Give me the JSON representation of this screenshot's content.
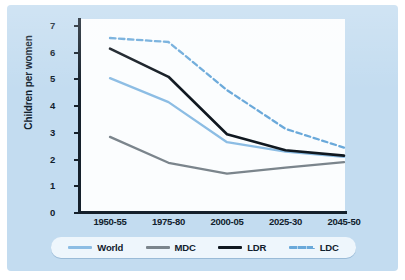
{
  "chart_data": {
    "type": "line",
    "title": "",
    "xlabel": "",
    "ylabel": "Children per women",
    "categories": [
      "1950-55",
      "1975-80",
      "2000-05",
      "2025-30",
      "2045-50"
    ],
    "ylim": [
      0,
      7
    ],
    "yticks": [
      0,
      1,
      2,
      3,
      4,
      5,
      6,
      7
    ],
    "grid": false,
    "legend_position": "bottom",
    "series": [
      {
        "name": "World",
        "values": [
          5.05,
          4.15,
          2.65,
          2.3,
          2.1
        ],
        "color": "#8cbde4",
        "style": "solid"
      },
      {
        "name": "MDC",
        "values": [
          2.85,
          1.88,
          1.47,
          1.7,
          1.9
        ],
        "color": "#7b858c",
        "style": "solid"
      },
      {
        "name": "LDR",
        "values": [
          6.15,
          5.1,
          2.95,
          2.35,
          2.15
        ],
        "color": "#101820",
        "style": "solid"
      },
      {
        "name": "LDC",
        "values": [
          6.55,
          6.4,
          4.6,
          3.15,
          2.45
        ],
        "color": "#6aa9da",
        "style": "dashed"
      }
    ]
  },
  "colors": {
    "figure_background": "#c3dcf0",
    "plot_background": "#fbfdfe",
    "axis": "#15202b",
    "legend_background": "#eef6fc"
  }
}
